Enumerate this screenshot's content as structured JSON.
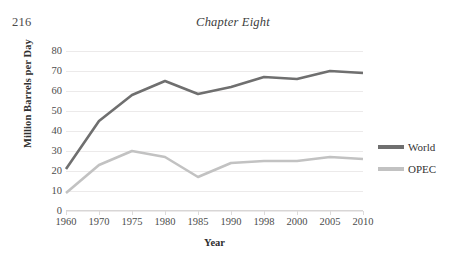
{
  "page": {
    "number": "216",
    "running_head": "Chapter Eight"
  },
  "chart_data": {
    "type": "line",
    "title": "",
    "xlabel": "Year",
    "ylabel": "Million Barrels per Day",
    "categories": [
      "1960",
      "1970",
      "1975",
      "1980",
      "1985",
      "1990",
      "1998",
      "2000",
      "2005",
      "2010"
    ],
    "yticks": [
      "80",
      "70",
      "60",
      "50",
      "40",
      "30",
      "20",
      "10",
      "0"
    ],
    "ylim": [
      0,
      80
    ],
    "grid": true,
    "legend_position": "right",
    "series": [
      {
        "name": "World",
        "color": "#6f6f6f",
        "values": [
          21,
          45,
          58,
          65,
          58.5,
          62,
          67,
          66,
          70,
          69
        ]
      },
      {
        "name": "OPEC",
        "color": "#c2c2c2",
        "values": [
          9,
          23,
          30,
          27,
          17,
          24,
          25,
          25,
          27,
          26
        ]
      }
    ]
  }
}
